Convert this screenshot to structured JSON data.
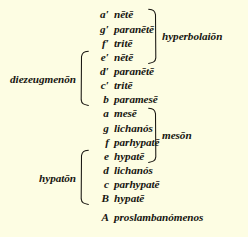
{
  "figure": {
    "kind": "greek-greater-perfect-system-scale-diagram",
    "background_color": "#fdfde3",
    "text_color": "#171510"
  },
  "notes": [
    {
      "degree": "a′",
      "name": "nētē"
    },
    {
      "degree": "g′",
      "name": "paranētē"
    },
    {
      "degree": "f′",
      "name": "tritē"
    },
    {
      "degree": "e′",
      "name": "nētē"
    },
    {
      "degree": "d′",
      "name": "paranētē"
    },
    {
      "degree": "c′",
      "name": "tritē"
    },
    {
      "degree": "b",
      "name": "paramesē"
    },
    {
      "degree": "a",
      "name": "mesē"
    },
    {
      "degree": "g",
      "name": "lichanós"
    },
    {
      "degree": "f",
      "name": "parhypatē"
    },
    {
      "degree": "e",
      "name": "hypatē"
    },
    {
      "degree": "d",
      "name": "lichanós"
    },
    {
      "degree": "c",
      "name": "parhypatē"
    },
    {
      "degree": "B",
      "name": "hypatē"
    }
  ],
  "standalone_note": {
    "degree": "A",
    "name": "proslambanómenos"
  },
  "groups": {
    "hyperbolaion": {
      "label": "hyperbolaiōn",
      "side": "right",
      "rows": [
        0,
        3
      ]
    },
    "diezeugmenon": {
      "label": "diezeugmenōn",
      "side": "left",
      "rows": [
        3,
        6
      ]
    },
    "meson": {
      "label": "mesōn",
      "side": "right",
      "rows": [
        7,
        10
      ]
    },
    "hypaton": {
      "label": "hypatōn",
      "side": "left",
      "rows": [
        10,
        13
      ]
    }
  }
}
